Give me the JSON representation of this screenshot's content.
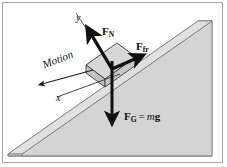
{
  "figure": {
    "background_color": "#ffffff",
    "frame_color": "#a8a8a8",
    "width": 227,
    "height": 167
  },
  "incline": {
    "name": "inclined-plane-wedge",
    "top_face_color": "#dcdcdc",
    "front_face_color": "#d2d2d2",
    "side_face_color": "#c9c9c9",
    "outline_color": "#6f6f6f"
  },
  "block": {
    "name": "block-on-incline",
    "fill_color": "#d0d0d0",
    "outline_color": "#3a3a3a"
  },
  "axes": {
    "y_label": "y",
    "x_label": "x",
    "line_color": "#222222"
  },
  "motion": {
    "label": "Motion",
    "arrow_direction": "down-left along incline"
  },
  "forces": [
    {
      "id": "normal",
      "symbol": "F",
      "subscript": "N",
      "label": "F N",
      "description": "Normal force, perpendicular to incline surface, pointing up-left",
      "color": "#111111"
    },
    {
      "id": "friction",
      "symbol": "F",
      "subscript": "fr",
      "label": "F fr",
      "description": "Friction force, along incline surface, pointing up-slope to the right",
      "color": "#111111"
    },
    {
      "id": "gravity",
      "symbol": "F",
      "subscript": "G",
      "equals": "=",
      "mass": "m",
      "gravity": "g",
      "label": "F G = mg",
      "description": "Gravitational force, straight down",
      "color": "#111111"
    }
  ]
}
